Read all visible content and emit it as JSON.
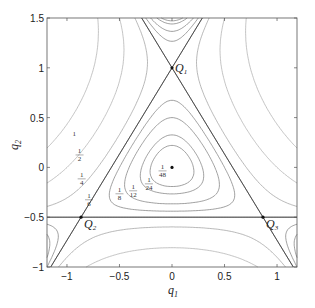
{
  "chart_data": {
    "type": "contour",
    "title": "",
    "xlabel": "q1",
    "ylabel": "q2",
    "xlim": [
      -1.19,
      1.19
    ],
    "ylim": [
      -1,
      1.5
    ],
    "xticks": [
      -1,
      -0.5,
      0,
      0.5,
      1
    ],
    "xtick_labels": [
      "−1",
      "−0.5",
      "0",
      "0.5",
      "1"
    ],
    "yticks": [
      -1,
      -0.5,
      0,
      0.5,
      1,
      1.5
    ],
    "ytick_labels": [
      "−1",
      "−0.5",
      "0",
      "0.5",
      "1",
      "1.5"
    ],
    "function": "V = (q1^2+q2^2)/2 + q1^2*q2 - q2^3/3",
    "levels": [
      0.0208333,
      0.0416667,
      0.0833333,
      0.125,
      0.1666667,
      0.25,
      0.5,
      1
    ],
    "level_labels": [
      "1/48",
      "1/24",
      "1/12",
      "1/8",
      "1/6",
      "1/4",
      "1/2",
      "1"
    ],
    "separatrix_lines": [
      {
        "from": [
          -1.19,
          -0.5
        ],
        "to": [
          1.19,
          -0.5
        ]
      },
      {
        "from": [
          -1.1547,
          -1.0
        ],
        "to": [
          0.2887,
          1.5
        ]
      },
      {
        "from": [
          1.1547,
          -1.0
        ],
        "to": [
          -0.2887,
          1.5
        ]
      }
    ],
    "points": [
      {
        "label": "Q1",
        "x": 0,
        "y": 1
      },
      {
        "label": "Q2",
        "x": -0.866,
        "y": -0.5
      },
      {
        "label": "Q3",
        "x": 0.866,
        "y": -0.5
      },
      {
        "label": "",
        "x": 0,
        "y": 0
      }
    ],
    "contour_label_positions": [
      {
        "text": "1",
        "x": -0.93,
        "y": 0.32
      },
      {
        "text": "1/2",
        "x": -0.88,
        "y": 0.12
      },
      {
        "text": "1/4",
        "x": -0.86,
        "y": -0.12
      },
      {
        "text": "1/6",
        "x": -0.79,
        "y": -0.33
      },
      {
        "text": "1/8",
        "x": -0.5,
        "y": -0.27
      },
      {
        "text": "1/12",
        "x": -0.37,
        "y": -0.24
      },
      {
        "text": "1/24",
        "x": -0.22,
        "y": -0.17
      },
      {
        "text": "1/48",
        "x": -0.09,
        "y": -0.04
      }
    ],
    "grid": false
  }
}
